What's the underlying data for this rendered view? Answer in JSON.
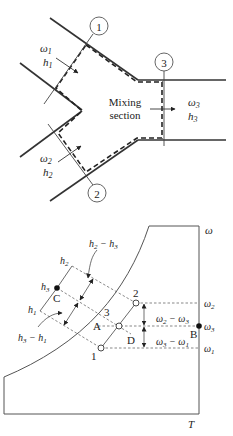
{
  "mixing_diagram": {
    "section_label_line1": "Mixing",
    "section_label_line2": "section",
    "inlet1": {
      "station": "1",
      "omega": "ω",
      "omega_sub": "1",
      "h": "h",
      "h_sub": "1"
    },
    "inlet2": {
      "station": "2",
      "omega": "ω",
      "omega_sub": "2",
      "h": "h",
      "h_sub": "2"
    },
    "outlet": {
      "station": "3",
      "omega": "ω",
      "omega_sub": "3",
      "h": "h",
      "h_sub": "3"
    }
  },
  "psychrometric_chart": {
    "y_axis_label": "ω",
    "x_axis_label": "T",
    "points": [
      {
        "label": "1",
        "type": "open"
      },
      {
        "label": "2",
        "type": "open"
      },
      {
        "label": "3",
        "type": "open"
      },
      {
        "label": "A",
        "type": "label"
      },
      {
        "label": "B",
        "type": "filled"
      },
      {
        "label": "C",
        "type": "filled"
      },
      {
        "label": "D",
        "type": "label"
      }
    ],
    "omega_ticks": [
      {
        "base": "ω",
        "sub": "2"
      },
      {
        "base": "ω",
        "sub": "3"
      },
      {
        "base": "ω",
        "sub": "1"
      }
    ],
    "h_labels": [
      {
        "base": "h",
        "sub": "2"
      },
      {
        "base": "h",
        "sub": "3"
      },
      {
        "base": "h",
        "sub": "1"
      }
    ],
    "differences": {
      "omega_upper": {
        "a": "ω",
        "a_sub": "2",
        "op": " − ",
        "b": "ω",
        "b_sub": "3"
      },
      "omega_lower": {
        "a": "ω",
        "a_sub": "3",
        "op": " − ",
        "b": "ω",
        "b_sub": "1"
      },
      "h_upper": {
        "a": "h",
        "a_sub": "2",
        "op": " − ",
        "b": "h",
        "b_sub": "3"
      },
      "h_lower": {
        "a": "h",
        "a_sub": "3",
        "op": " − ",
        "b": "h",
        "b_sub": "1"
      }
    }
  }
}
